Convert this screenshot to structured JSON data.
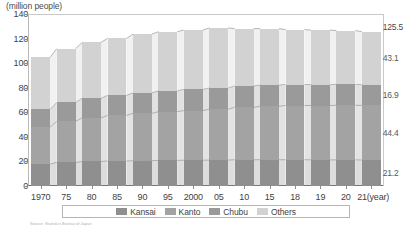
{
  "axis": {
    "unit_label": "(million people)",
    "y_ticks": [
      0,
      20,
      40,
      60,
      80,
      100,
      120,
      140
    ],
    "y_min": 0,
    "y_max": 140,
    "x_unit_label": "(year)"
  },
  "legend": {
    "items": [
      {
        "label": "Kansai",
        "color": "#8f8f8f"
      },
      {
        "label": "Kanto",
        "color": "#a3a3a3"
      },
      {
        "label": "Chubu",
        "color": "#9a9a9a"
      },
      {
        "label": "Others",
        "color": "#d2d2d2"
      }
    ]
  },
  "end_labels": {
    "total": "125.5",
    "others": "43.1",
    "chubu": "16.9",
    "kanto": "44.4",
    "kansai": "21.2"
  },
  "source": "Source: Statistics Bureau of Japan",
  "chart_data": {
    "type": "bar",
    "stacked": true,
    "title": "",
    "xlabel": "(year)",
    "ylabel": "(million people)",
    "ylim": [
      0,
      140
    ],
    "grid": false,
    "legend_position": "bottom",
    "categories": [
      "1970",
      "75",
      "80",
      "85",
      "90",
      "95",
      "2000",
      "05",
      "10",
      "15",
      "18",
      "19",
      "20",
      "21"
    ],
    "series": [
      {
        "name": "Kansai",
        "color": "#8f8f8f",
        "values": [
          17.8,
          19.2,
          20.0,
          20.4,
          20.6,
          20.9,
          21.0,
          21.1,
          21.4,
          21.4,
          21.4,
          21.3,
          21.3,
          21.2
        ]
      },
      {
        "name": "Kanto",
        "color": "#a3a3a3",
        "values": [
          30.1,
          33.4,
          35.4,
          37.0,
          38.5,
          39.6,
          40.4,
          41.4,
          42.6,
          43.5,
          44.1,
          44.2,
          44.4,
          44.4
        ]
      },
      {
        "name": "Chubu",
        "color": "#9a9a9a",
        "values": [
          14.5,
          15.4,
          16.0,
          16.4,
          16.7,
          17.0,
          17.2,
          17.3,
          17.4,
          17.3,
          17.1,
          17.1,
          17.0,
          16.9
        ]
      },
      {
        "name": "Others",
        "color": "#d2d2d2",
        "values": [
          42.3,
          43.8,
          45.5,
          46.3,
          47.8,
          48.1,
          48.3,
          48.9,
          46.7,
          45.9,
          44.7,
          44.3,
          43.8,
          43.1
        ]
      }
    ],
    "totals": [
      104.7,
      111.8,
      116.9,
      120.1,
      123.6,
      125.6,
      126.9,
      128.7,
      128.1,
      128.1,
      127.3,
      126.9,
      126.5,
      125.5
    ],
    "end_value_labels": {
      "total": 125.5,
      "Others": 43.1,
      "Chubu": 16.9,
      "Kanto": 44.4,
      "Kansai": 21.2
    }
  }
}
